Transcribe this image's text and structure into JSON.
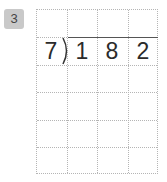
{
  "problem": {
    "number": "3",
    "divisor": "7",
    "dividend_digits": [
      "1",
      "8",
      "2"
    ]
  },
  "grid": {
    "columns": 4,
    "rows": 6,
    "line_color": "#b5b5b5"
  },
  "colors": {
    "badge_bg": "#c9c9c9",
    "text": "#2b2b2b"
  }
}
